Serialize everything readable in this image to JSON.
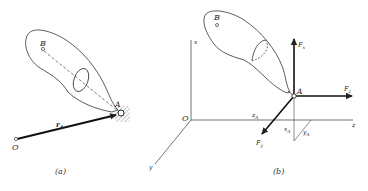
{
  "figure": {
    "panel_a": {
      "caption": "(a)",
      "labels": {
        "point_b": "B",
        "point_a": "A",
        "origin": "O",
        "position_vector": "r",
        "position_vector_sub": "A"
      }
    },
    "panel_b": {
      "caption": "(b)",
      "axes": {
        "x": "x",
        "y": "y",
        "z": "z",
        "origin": "O"
      },
      "labels": {
        "point_b": "B",
        "point_a": "A"
      },
      "forces": {
        "fx": "F",
        "fx_sub": "x",
        "fy": "F",
        "fy_sub": "y",
        "fz": "F",
        "fz_sub": "z"
      },
      "dimensions": {
        "xa": "x",
        "xa_sub": "A",
        "ya": "y",
        "ya_sub": "A",
        "za": "z",
        "za_sub": "A"
      }
    },
    "colors": {
      "ink": "#222222",
      "hatch": "#888888",
      "background": "#ffffff"
    }
  }
}
